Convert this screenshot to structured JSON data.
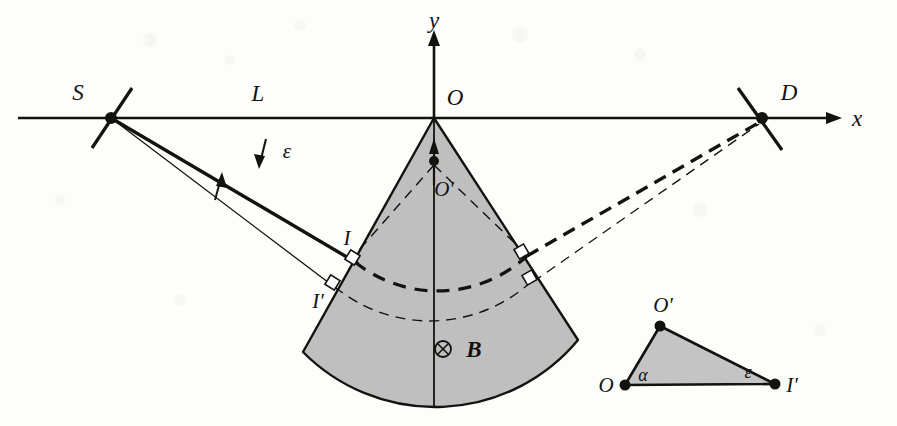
{
  "figure": {
    "background_color": "#fdfdfc",
    "ink_color": "#14120f",
    "wedge_fill": "#bfbfbf",
    "triangle_fill": "#c4c4c4"
  },
  "axes": {
    "x_label": "x",
    "y_label": "y",
    "origin_label": "O",
    "x_axis_y": 118,
    "y_axis_x": 434
  },
  "labels": {
    "source": "S",
    "detector": "D",
    "distance": "L",
    "origin": "O",
    "center_prime": "O'",
    "entry_point": "I",
    "entry_point_prime": "I'",
    "small_angle": "ε",
    "field": "B",
    "field_symbol": "⊗",
    "alpha": "α"
  },
  "points": {
    "S": {
      "label": "S",
      "x": 111,
      "y": 118
    },
    "D": {
      "label": "D",
      "x": 762,
      "y": 118
    },
    "O": {
      "label": "O",
      "x": 434,
      "y": 118
    },
    "O_prime": {
      "label": "O'",
      "x": 434,
      "y": 161
    },
    "I": {
      "label": "I",
      "x": 355,
      "y": 262
    },
    "I_prime": {
      "label": "I'",
      "x": 335,
      "y": 287
    }
  },
  "wedge": {
    "apex_label": "O",
    "inner_point_label": "O'",
    "field_label": "B",
    "field_direction": "into-page"
  },
  "inset_triangle": {
    "vertices": [
      {
        "label": "O",
        "position": "bottom-left"
      },
      {
        "label": "O'",
        "position": "top"
      },
      {
        "label": "I'",
        "position": "bottom-right"
      }
    ],
    "angles": [
      {
        "label": "α",
        "at": "O"
      },
      {
        "label": "ε",
        "at": "I'"
      }
    ]
  },
  "annotations": {
    "epsilon_between_rays": "ε",
    "right_angle_marks": 4
  }
}
